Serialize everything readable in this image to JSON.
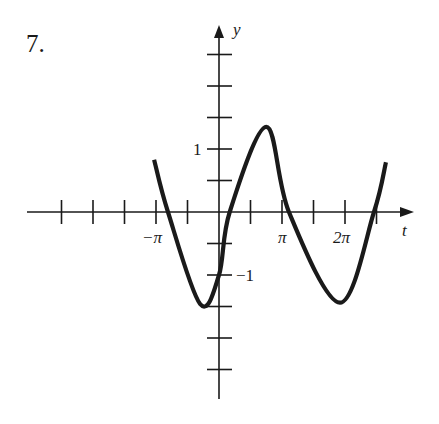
{
  "problem_number": "7.",
  "axes": {
    "x_label": "t",
    "y_label": "y",
    "x_tick_labels": [
      {
        "text": "−π",
        "t_over_pi": -1
      },
      {
        "text": "π",
        "t_over_pi": 1
      },
      {
        "text": "2π",
        "t_over_pi": 2
      }
    ],
    "y_tick_labels": [
      {
        "text": "1",
        "value": 1
      },
      {
        "text": "−1",
        "value": -1
      }
    ],
    "x_tick_step": "π/2",
    "y_tick_step": 0.5,
    "x_range_over_pi": [
      -3,
      2.5
    ],
    "y_range": [
      -3,
      3
    ]
  },
  "chart_data": {
    "type": "line",
    "title": "7.",
    "xlabel": "t",
    "ylabel": "y",
    "key_points": [
      {
        "t_over_pi": -1.03,
        "y": 0.83,
        "note": "left endpoint"
      },
      {
        "t_over_pi": -0.81,
        "y": 0,
        "note": "zero crossing"
      },
      {
        "t_over_pi": -0.3,
        "y": -1.46,
        "note": "minimum"
      },
      {
        "t_over_pi": 0,
        "y": -1.0,
        "note": "y-intercept"
      },
      {
        "t_over_pi": 0.17,
        "y": 0,
        "note": "zero crossing"
      },
      {
        "t_over_pi": 0.75,
        "y": 1.35,
        "note": "maximum"
      },
      {
        "t_over_pi": 1.11,
        "y": 0,
        "note": "zero crossing"
      },
      {
        "t_over_pi": 1.92,
        "y": -1.44,
        "note": "minimum"
      },
      {
        "t_over_pi": 2.46,
        "y": 0,
        "note": "zero crossing"
      },
      {
        "t_over_pi": 2.65,
        "y": 0.79,
        "note": "right endpoint"
      }
    ],
    "xlim_over_pi": [
      -3.05,
      3.1
    ],
    "ylim": [
      -2.96,
      2.96
    ],
    "grid": false
  },
  "colors": {
    "ink": "#1a1a1a",
    "background": "#ffffff"
  }
}
